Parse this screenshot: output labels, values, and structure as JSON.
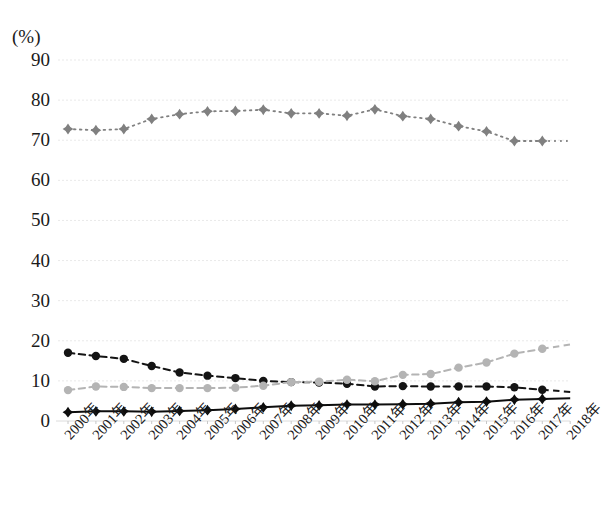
{
  "chart_data": {
    "type": "line",
    "title": "",
    "subtitle": "",
    "xlabel": "",
    "ylabel": "(%)",
    "unit_label": "(%)",
    "ylim": [
      0,
      90
    ],
    "ytick_values": [
      0,
      10,
      20,
      30,
      40,
      50,
      60,
      70,
      80,
      90
    ],
    "ytick_labels": [
      "0",
      "10",
      "20",
      "30",
      "40",
      "50",
      "60",
      "70",
      "80",
      "90"
    ],
    "grid": true,
    "grid_axis": "y",
    "legend": "none",
    "categories": [
      "2000年",
      "2001年",
      "2002年",
      "2003年",
      "2004年",
      "2005年",
      "2006年",
      "2007年",
      "2008年",
      "2009年",
      "2010年",
      "2011年",
      "2012年",
      "2013年",
      "2014年",
      "2015年",
      "2016年",
      "2017年",
      "2018年"
    ],
    "x": [
      2000,
      2001,
      2002,
      2003,
      2004,
      2005,
      2006,
      2007,
      2008,
      2009,
      2010,
      2011,
      2012,
      2013,
      2014,
      2015,
      2016,
      2017,
      2018
    ],
    "series": [
      {
        "name": "series-gray-diamond-high",
        "marker": "diamond",
        "linestyle": "dotted",
        "color": "#808080",
        "values": [
          72.8,
          72.5,
          72.8,
          75.3,
          76.5,
          77.2,
          77.3,
          77.6,
          76.7,
          76.7,
          76.1,
          77.7,
          76.0,
          75.3,
          73.5,
          72.2,
          69.8,
          69.8,
          null
        ]
      },
      {
        "name": "series-black-circle-declining",
        "marker": "circle",
        "linestyle": "dashed",
        "color": "#141414",
        "values": [
          17.0,
          16.2,
          15.5,
          13.7,
          12.1,
          11.3,
          10.7,
          10.0,
          9.7,
          9.6,
          9.3,
          8.6,
          8.7,
          8.6,
          8.6,
          8.6,
          8.4,
          7.8,
          null
        ]
      },
      {
        "name": "series-lightgray-circle-rising",
        "marker": "circle",
        "linestyle": "dashed",
        "color": "#b4b4b4",
        "values": [
          7.7,
          8.6,
          8.5,
          8.2,
          8.2,
          8.2,
          8.3,
          8.8,
          9.7,
          9.8,
          10.3,
          9.9,
          11.5,
          11.7,
          13.3,
          14.6,
          16.8,
          18.0,
          null
        ]
      },
      {
        "name": "series-black-diamond-low",
        "marker": "diamond",
        "linestyle": "solid",
        "color": "#0d0d0d",
        "values": [
          2.2,
          2.4,
          2.4,
          2.3,
          2.5,
          2.7,
          3.0,
          3.4,
          3.8,
          3.9,
          4.1,
          4.1,
          4.2,
          4.3,
          4.7,
          4.8,
          5.3,
          5.5,
          null
        ]
      }
    ]
  }
}
